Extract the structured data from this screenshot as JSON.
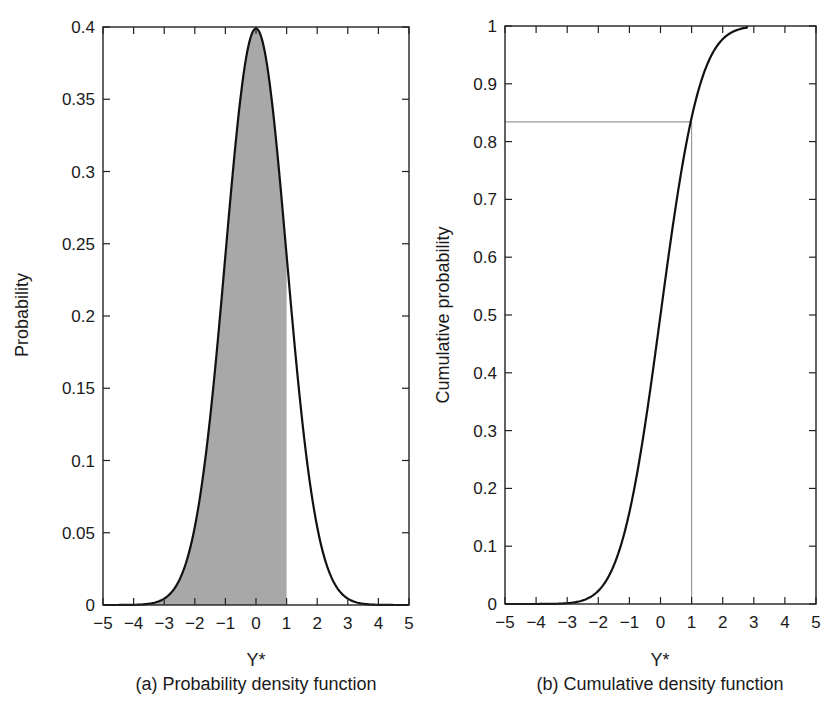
{
  "chart_data": [
    {
      "type": "area",
      "title": "(a) Probability density function",
      "xlabel": "Y*",
      "ylabel": "Probability",
      "xlim": [
        -5,
        5
      ],
      "ylim": [
        0,
        0.4
      ],
      "xticks": [
        -5,
        -4,
        -3,
        -2,
        -1,
        0,
        1,
        2,
        3,
        4,
        5
      ],
      "xtick_labels": [
        "−5",
        "−4",
        "−3",
        "−2",
        "−1",
        "0",
        "1",
        "2",
        "3",
        "4",
        "5"
      ],
      "yticks": [
        0,
        0.05,
        0.1,
        0.15,
        0.2,
        0.25,
        0.3,
        0.35,
        0.4
      ],
      "ytick_labels": [
        "0",
        "0.05",
        "0.1",
        "0.15",
        "0.2",
        "0.25",
        "0.3",
        "0.35",
        "0.4"
      ],
      "grid": false,
      "series": [
        {
          "name": "Standard normal PDF",
          "x": [
            -5,
            -4,
            -3,
            -2.5,
            -2,
            -1.5,
            -1,
            -0.5,
            0,
            0.5,
            1,
            1.5,
            2,
            2.5,
            3,
            4,
            5
          ],
          "values": [
            0.0,
            0.0001,
            0.0044,
            0.0175,
            0.054,
            0.1295,
            0.242,
            0.3521,
            0.3989,
            0.3521,
            0.242,
            0.1295,
            0.054,
            0.0175,
            0.0044,
            0.0001,
            0.0
          ]
        }
      ],
      "shaded_region": {
        "from": -5,
        "to": 1,
        "color": "#a8a8a8",
        "label": "P(Y* ≤ 1)"
      },
      "colors": {
        "curve": "#111111",
        "shade": "#a8a8a8",
        "frame": "#222222"
      }
    },
    {
      "type": "line",
      "title": "(b) Cumulative density function",
      "xlabel": "Y*",
      "ylabel": "Cumulative probability",
      "xlim": [
        -5,
        5
      ],
      "ylim": [
        0,
        1
      ],
      "xticks": [
        -5,
        -4,
        -3,
        -2,
        -1,
        0,
        1,
        2,
        3,
        4,
        5
      ],
      "xtick_labels": [
        "−5",
        "−4",
        "−3",
        "−2",
        "−1",
        "0",
        "1",
        "2",
        "3",
        "4",
        "5"
      ],
      "yticks": [
        0,
        0.1,
        0.2,
        0.3,
        0.4,
        0.5,
        0.6,
        0.7,
        0.8,
        0.9,
        1
      ],
      "ytick_labels": [
        "0",
        "0.1",
        "0.2",
        "0.3",
        "0.4",
        "0.5",
        "0.6",
        "0.7",
        "0.8",
        "0.9",
        "1"
      ],
      "grid": false,
      "series": [
        {
          "name": "Standard normal CDF",
          "x": [
            -5,
            -3,
            -2.5,
            -2,
            -1.5,
            -1,
            -0.5,
            0,
            0.5,
            1,
            1.5,
            2,
            2.5,
            2.8
          ],
          "values": [
            0.0,
            0.0013,
            0.0062,
            0.0228,
            0.0668,
            0.1587,
            0.3085,
            0.5,
            0.6915,
            0.8413,
            0.9332,
            0.9772,
            0.9938,
            1.0
          ]
        }
      ],
      "reference_lines": [
        {
          "orientation": "vertical",
          "x": 1,
          "from_y": 0,
          "to_y": 0.834
        },
        {
          "orientation": "horizontal",
          "y": 0.834,
          "from_x": -5,
          "to_x": 1
        }
      ],
      "colors": {
        "curve": "#111111",
        "reference": "#9a9a9a",
        "frame": "#222222"
      }
    }
  ],
  "left": {
    "ylabel": "Probability",
    "xlabel": "Y*",
    "caption": "(a) Probability density function"
  },
  "right": {
    "ylabel": "Cumulative probability",
    "xlabel": "Y*",
    "caption": "(b) Cumulative density function"
  }
}
